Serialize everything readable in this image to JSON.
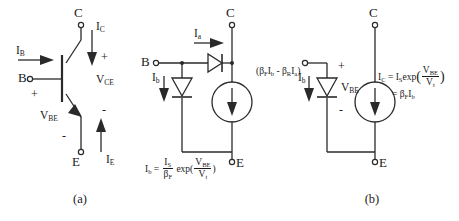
{
  "figure": {
    "type": "bjt-model-diagrams",
    "panels": [
      {
        "caption": "(a)",
        "title": "npn-bipolar-transistor-symbol",
        "terminals": {
          "collector": "C",
          "base": "B",
          "emitter": "E"
        },
        "currents": {
          "collector": "I",
          "collector_sub": "C",
          "base": "I",
          "base_sub": "B",
          "emitter": "I",
          "emitter_sub": "E"
        },
        "voltages": {
          "vce": "V",
          "vce_sub": "CE",
          "vbe": "V",
          "vbe_sub": "BE"
        },
        "polarity": {
          "vce_plus": "+",
          "vce_minus": "-",
          "vbe_plus": "+",
          "vbe_minus": "-"
        }
      },
      {
        "caption": "(b)",
        "title": "ebers-moll-two-diode-model",
        "terminals": {
          "collector": "C",
          "base": "B",
          "emitter": "E"
        },
        "currents": {
          "ia": "I",
          "ia_sub": "a",
          "ib": "I",
          "ib_sub": "b"
        },
        "source_label": {
          "open_paren": "(",
          "beta_f": "β",
          "beta_f_sub": "F",
          "i_b": "I",
          "i_b_sub": "b",
          "minus": "-",
          "beta_r": "β",
          "beta_r_sub": "R",
          "i_a": "I",
          "i_a_sub": "a",
          "close_paren": ")"
        },
        "equation": {
          "lhs": "I",
          "lhs_sub": "b",
          "equals": "=",
          "num": "I",
          "num_sub": "S",
          "den": "β",
          "den_sub": "F",
          "exp": "exp(",
          "exp_num": "V",
          "exp_num_sub": "BE",
          "exp_den": "V",
          "exp_den_sub": "t",
          "close": ")"
        }
      },
      {
        "caption": "(c)",
        "title": "forward-active-simplified-model",
        "terminals": {
          "collector": "C",
          "base": "B",
          "emitter": "E"
        },
        "currents": {
          "ib": "I",
          "ib_sub": "b",
          "ic": "I",
          "ic_sub": "C"
        },
        "voltages": {
          "vbe": "V",
          "vbe_sub": "BE"
        },
        "polarity": {
          "plus": "+",
          "minus": "-"
        },
        "equation": {
          "lhs": "I",
          "lhs_sub": "C",
          "equals": "=",
          "is": "I",
          "is_sub": "S",
          "exp": "exp",
          "open": "(",
          "exp_num": "V",
          "exp_num_sub": "BE",
          "exp_den": "V",
          "exp_den_sub": "t",
          "close": ")",
          "equals2": "=",
          "beta": "β",
          "beta_sub": "F",
          "ib": "I",
          "ib_sub": "b"
        }
      }
    ]
  },
  "style": {
    "line_color": "#2a2a2a",
    "background": "#ffffff"
  }
}
